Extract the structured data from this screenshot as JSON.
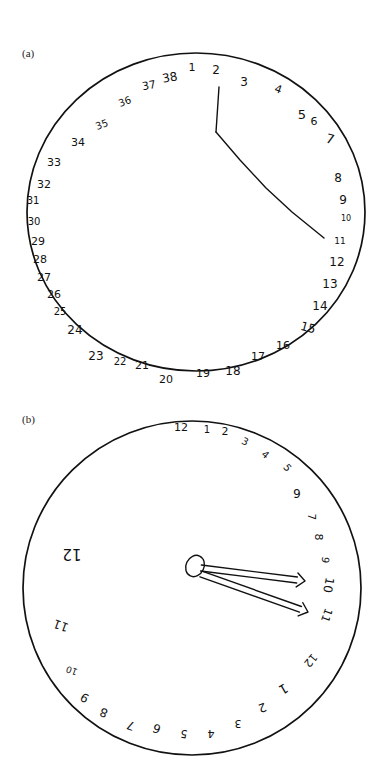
{
  "figure": {
    "panels": [
      {
        "label": "(a)",
        "description": "Hand-drawn clock face with numbers 1 through 38 written around the circumference and two hands",
        "clock": {
          "cx": 196,
          "cy": 212,
          "r": 168,
          "numbers": [
            {
              "text": "1",
              "x": 192,
              "y": 68,
              "size": 11
            },
            {
              "text": "2",
              "x": 216,
              "y": 70,
              "size": 12
            },
            {
              "text": "3",
              "x": 244,
              "y": 82,
              "size": 12
            },
            {
              "text": "4",
              "x": 278,
              "y": 90,
              "size": 11,
              "rotate": 20
            },
            {
              "text": "5",
              "x": 302,
              "y": 115,
              "size": 13
            },
            {
              "text": "6",
              "x": 314,
              "y": 122,
              "size": 11
            },
            {
              "text": "7",
              "x": 330,
              "y": 140,
              "size": 13,
              "rotate": 15
            },
            {
              "text": "8",
              "x": 338,
              "y": 178,
              "size": 12
            },
            {
              "text": "9",
              "x": 343,
              "y": 200,
              "size": 12
            },
            {
              "text": "10",
              "x": 346,
              "y": 218,
              "size": 8
            },
            {
              "text": "11",
              "x": 340,
              "y": 241,
              "size": 9
            },
            {
              "text": "12",
              "x": 337,
              "y": 262,
              "size": 12
            },
            {
              "text": "13",
              "x": 330,
              "y": 284,
              "size": 12
            },
            {
              "text": "14",
              "x": 320,
              "y": 306,
              "size": 12
            },
            {
              "text": "15",
              "x": 308,
              "y": 328,
              "size": 12,
              "rotate": 15
            },
            {
              "text": "16",
              "x": 283,
              "y": 346,
              "size": 11
            },
            {
              "text": "17",
              "x": 258,
              "y": 357,
              "size": 11
            },
            {
              "text": "18",
              "x": 233,
              "y": 371,
              "size": 12
            },
            {
              "text": "19",
              "x": 203,
              "y": 374,
              "size": 11
            },
            {
              "text": "20",
              "x": 166,
              "y": 380,
              "size": 11
            },
            {
              "text": "21",
              "x": 142,
              "y": 366,
              "size": 11
            },
            {
              "text": "22",
              "x": 120,
              "y": 362,
              "size": 10
            },
            {
              "text": "23",
              "x": 96,
              "y": 356,
              "size": 12
            },
            {
              "text": "24",
              "x": 75,
              "y": 330,
              "size": 12
            },
            {
              "text": "25",
              "x": 60,
              "y": 312,
              "size": 10
            },
            {
              "text": "26",
              "x": 54,
              "y": 295,
              "size": 11
            },
            {
              "text": "27",
              "x": 44,
              "y": 278,
              "size": 11
            },
            {
              "text": "28",
              "x": 40,
              "y": 260,
              "size": 11
            },
            {
              "text": "29",
              "x": 38,
              "y": 242,
              "size": 11
            },
            {
              "text": "30",
              "x": 34,
              "y": 222,
              "size": 10
            },
            {
              "text": "31",
              "x": 33,
              "y": 201,
              "size": 10
            },
            {
              "text": "32",
              "x": 44,
              "y": 185,
              "size": 11
            },
            {
              "text": "33",
              "x": 54,
              "y": 163,
              "size": 11
            },
            {
              "text": "34",
              "x": 78,
              "y": 143,
              "size": 11
            },
            {
              "text": "35",
              "x": 102,
              "y": 125,
              "size": 10,
              "rotate": -20
            },
            {
              "text": "36",
              "x": 125,
              "y": 102,
              "size": 10,
              "rotate": -20
            },
            {
              "text": "37",
              "x": 149,
              "y": 86,
              "size": 11,
              "rotate": -10
            },
            {
              "text": "38",
              "x": 170,
              "y": 78,
              "size": 12,
              "rotate": -10
            }
          ],
          "hands": [
            {
              "name": "hand-vertical",
              "points": "219,87 216,132"
            },
            {
              "name": "hand-diagonal",
              "points": "216,132 240,160 266,188 292,212 324,238"
            }
          ]
        }
      },
      {
        "label": "(b)",
        "description": "Hand-drawn clock face with numbers written around the right side and bottom, some reversed; two arrow-tipped hands from a central oval",
        "clock": {
          "cx": 192,
          "cy": 588,
          "r": 168,
          "numbers": [
            {
              "text": "12",
              "x": 181,
              "y": 428,
              "size": 11
            },
            {
              "text": "1",
              "x": 207,
              "y": 430,
              "size": 10
            },
            {
              "text": "2",
              "x": 225,
              "y": 432,
              "size": 11
            },
            {
              "text": "3",
              "x": 245,
              "y": 442,
              "size": 10,
              "rotate": 25
            },
            {
              "text": "4",
              "x": 265,
              "y": 455,
              "size": 10,
              "rotate": 40
            },
            {
              "text": "5",
              "x": 287,
              "y": 468,
              "size": 10,
              "rotate": 50
            },
            {
              "text": "6",
              "x": 297,
              "y": 492,
              "size": 12,
              "rotate": 180
            },
            {
              "text": "7",
              "x": 311,
              "y": 517,
              "size": 10,
              "rotate": 90
            },
            {
              "text": "8",
              "x": 318,
              "y": 537,
              "size": 11,
              "rotate": 90
            },
            {
              "text": "9",
              "x": 325,
              "y": 560,
              "size": 10,
              "rotate": 100
            },
            {
              "text": "10",
              "x": 328,
              "y": 585,
              "size": 12,
              "rotate": 100
            },
            {
              "text": "11",
              "x": 326,
              "y": 615,
              "size": 11,
              "rotate": 110
            },
            {
              "text": "12",
              "x": 310,
              "y": 660,
              "size": 11,
              "rotate": 130
            },
            {
              "text": "1",
              "x": 283,
              "y": 688,
              "size": 13,
              "rotate": 150
            },
            {
              "text": "2",
              "x": 262,
              "y": 707,
              "size": 12,
              "rotate": 160
            },
            {
              "text": "3",
              "x": 238,
              "y": 723,
              "size": 11,
              "rotate": 180
            },
            {
              "text": "4",
              "x": 211,
              "y": 733,
              "size": 11,
              "rotate": 180
            },
            {
              "text": "5",
              "x": 184,
              "y": 733,
              "size": 11,
              "rotate": 190
            },
            {
              "text": "6",
              "x": 157,
              "y": 728,
              "size": 12,
              "rotate": 200
            },
            {
              "text": "7",
              "x": 131,
              "y": 725,
              "size": 12,
              "rotate": 200
            },
            {
              "text": "8",
              "x": 104,
              "y": 712,
              "size": 12,
              "rotate": 200
            },
            {
              "text": "9",
              "x": 85,
              "y": 697,
              "size": 12,
              "rotate": 210
            },
            {
              "text": "10",
              "x": 72,
              "y": 670,
              "size": 9,
              "rotate": 200
            },
            {
              "text": "11",
              "x": 61,
              "y": 625,
              "size": 12,
              "rotate": 200
            },
            {
              "text": "12",
              "x": 72,
              "y": 553,
              "size": 15,
              "rotate": 180
            }
          ],
          "hub": {
            "cx": 195,
            "cy": 566,
            "rx": 9,
            "ry": 11
          },
          "hands": [
            {
              "name": "hand-upper-arrow",
              "tip": [
                305,
                581
              ]
            },
            {
              "name": "hand-lower-arrow",
              "tip": [
                308,
                612
              ]
            }
          ]
        }
      }
    ]
  }
}
